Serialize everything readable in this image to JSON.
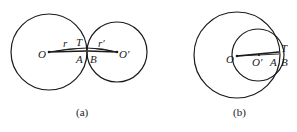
{
  "figure_a": {
    "caption": "(a)",
    "labels": {
      "O": "O",
      "O_prime": "O′",
      "r": "r",
      "r_prime": "r′",
      "T": "T",
      "A": "A",
      "B": "B"
    },
    "circle_O": {
      "cx": 49,
      "cy": 52,
      "r": 38
    },
    "circle_O_prime": {
      "cx": 117,
      "cy": 52,
      "r": 30
    }
  },
  "figure_b": {
    "caption": "(b)",
    "labels": {
      "O": "O",
      "O_prime": "O′",
      "T": "T",
      "A": "A",
      "B": "B"
    },
    "circle_O": {
      "cx": 237,
      "cy": 55,
      "r": 43
    },
    "circle_O_prime": {
      "cx": 258,
      "cy": 55,
      "r": 26
    }
  },
  "colors": {
    "stroke": "#1a1a1a",
    "background": "#ffffff"
  }
}
